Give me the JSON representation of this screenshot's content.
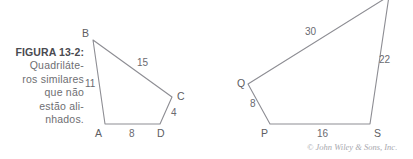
{
  "figure": {
    "caption_lines": [
      "FIGURA 13-2:",
      "Quadriláte-",
      "ros similares",
      "que não",
      "estão ali-",
      "nhados."
    ],
    "copyright": "© John Wiley & Sons, Inc.",
    "colors": {
      "background": "#ffffff",
      "stroke": "#8d8d93",
      "caption_text": "#6e6e72",
      "caption_bold_text": "#4a4a50",
      "label_text": "#5d5d62",
      "copyright_text": "#a8a8ae"
    },
    "shapes": [
      {
        "name": "quadrilateral-abcd",
        "vertices": [
          {
            "label": "B",
            "x": 93,
            "y": 40,
            "lx": 82,
            "ly": 27
          },
          {
            "label": "C",
            "x": 172,
            "y": 97,
            "lx": 177,
            "ly": 90
          },
          {
            "label": "D",
            "x": 160,
            "y": 124,
            "lx": 157,
            "ly": 127
          },
          {
            "label": "A",
            "x": 105,
            "y": 124,
            "lx": 95,
            "ly": 127
          }
        ],
        "edges": [
          {
            "from": "B",
            "to": "C",
            "length": "15",
            "lx": 137,
            "ly": 57
          },
          {
            "from": "C",
            "to": "D",
            "length": "4",
            "lx": 171,
            "ly": 107
          },
          {
            "from": "D",
            "to": "A",
            "length": "8",
            "lx": 129,
            "ly": 128
          },
          {
            "from": "A",
            "to": "B",
            "length": "11",
            "lx": 85,
            "ly": 78
          }
        ]
      },
      {
        "name": "quadrilateral-pqrs",
        "vertices": [
          {
            "label": "R",
            "x": 389,
            "y": -4,
            "lx": 392,
            "ly": -14
          },
          {
            "label": "S",
            "x": 370,
            "y": 124,
            "lx": 374,
            "ly": 127
          },
          {
            "label": "P",
            "x": 270,
            "y": 124,
            "lx": 261,
            "ly": 127
          },
          {
            "label": "Q",
            "x": 248,
            "y": 84,
            "lx": 237,
            "ly": 77
          }
        ],
        "edges": [
          {
            "from": "Q",
            "to": "R",
            "length": "30",
            "lx": 305,
            "ly": 26
          },
          {
            "from": "R",
            "to": "S",
            "length": "22",
            "lx": 379,
            "ly": 54
          },
          {
            "from": "S",
            "to": "P",
            "length": "16",
            "lx": 317,
            "ly": 128
          },
          {
            "from": "P",
            "to": "Q",
            "length": "8",
            "lx": 250,
            "ly": 98
          }
        ]
      }
    ],
    "copyright_pos": {
      "x": 307,
      "y": 142
    }
  }
}
